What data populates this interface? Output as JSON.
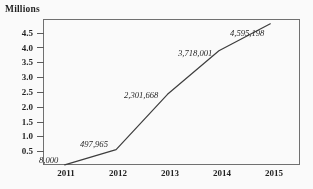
{
  "chart_data": {
    "type": "line",
    "title": "",
    "subtitle": "",
    "xlabel": "",
    "ylabel": "Millions",
    "categories": [
      "2011",
      "2012",
      "2013",
      "2014",
      "2015"
    ],
    "x": [
      2011,
      2012,
      2013,
      2014,
      2015
    ],
    "values": [
      0.008,
      0.497965,
      2.301668,
      3.718001,
      4.595198
    ],
    "point_labels": [
      "8,000",
      "497,965",
      "2,301,668",
      "3,718,001",
      "4,595,198"
    ],
    "raw_values": [
      8000,
      497965,
      2301668,
      3718001,
      4595198
    ],
    "units": "Millions",
    "ylim": [
      0,
      4.75
    ],
    "ytick_labels": [
      "0.5",
      "1.0",
      "1.5",
      "2.0",
      "2.5",
      "3.0",
      "3.5",
      "4.0",
      "4.5"
    ],
    "ytick_values": [
      0.5,
      1.0,
      1.5,
      2.0,
      2.5,
      3.0,
      3.5,
      4.0,
      4.5
    ],
    "xtick_labels": [
      "2011",
      "2012",
      "2013",
      "2014",
      "2015"
    ],
    "grid": false,
    "legend": false,
    "legend_position": "none",
    "series": [
      {
        "name": "Millions",
        "values": [
          0.008,
          0.497965,
          2.301668,
          3.718001,
          4.595198
        ],
        "color": "#3a3a3a",
        "marker": "none",
        "line_width": 1.2
      }
    ],
    "colors": {
      "line": "#3a3a3a",
      "axis": "#6f6f6f",
      "text": "#1d1d1d",
      "background": "#ffffff"
    }
  }
}
